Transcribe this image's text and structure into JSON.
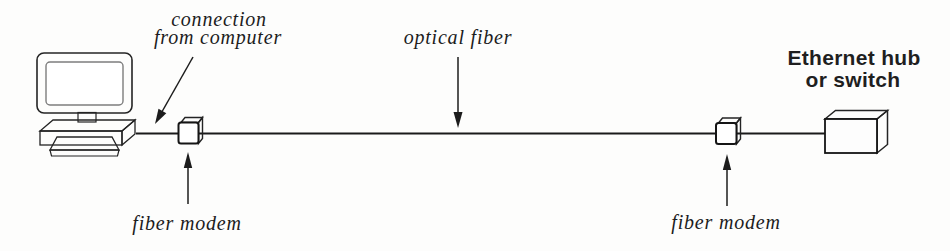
{
  "figure": {
    "type": "network-diagram",
    "colors": {
      "background": "#fdfdfc",
      "ink": "#1c1c1c",
      "monitor_frame_grey": "#9c9c9c",
      "screen_white": "#ffffff",
      "base_grey": "#8e8e8e",
      "hub_side_dark": "#3a3a3a",
      "hub_top_light": "#cccccc"
    },
    "labels": {
      "connection": {
        "line1": "connection",
        "line2": "from computer"
      },
      "optical_fiber": "optical fiber",
      "fiber_modem_left": "fiber modem",
      "fiber_modem_right": "fiber modem",
      "hub": {
        "line1": "Ethernet hub",
        "line2": "or switch"
      }
    },
    "nodes": [
      {
        "id": "computer",
        "icon": "computer-icon"
      },
      {
        "id": "fiber-modem-left",
        "icon": "fiber-modem-icon"
      },
      {
        "id": "optical-fiber-link",
        "icon": "fiber-line"
      },
      {
        "id": "fiber-modem-right",
        "icon": "fiber-modem-icon"
      },
      {
        "id": "ethernet-hub-or-switch",
        "icon": "ethernet-hub-icon"
      }
    ]
  }
}
